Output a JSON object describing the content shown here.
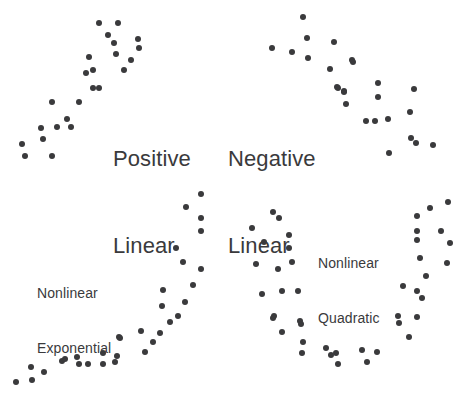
{
  "figure": {
    "width": 473,
    "height": 403,
    "background": "#ffffff",
    "dot_color": "#3a3a3c",
    "dot_diameter_px": 6
  },
  "chart_data": {
    "type": "scatter",
    "title": "",
    "xlabel": "",
    "ylabel": "",
    "grid": false,
    "legend": "none",
    "axes_shown": false,
    "note": "Four unlabeled-axis scatterplot panels illustrating relationship shapes. Point coordinates are given in figure pixel space (origin top-left, x right, y down).",
    "panels": [
      {
        "id": "positive-linear",
        "label_line1": "Positive",
        "label_line2": "Linear",
        "label_style": "large",
        "label_x": 113,
        "label_y": 86,
        "relationship": "positive linear",
        "n_points": 24,
        "points": [
          [
            99,
            23
          ],
          [
            118,
            23
          ],
          [
            114,
            43
          ],
          [
            138,
            39
          ],
          [
            139,
            48
          ],
          [
            89,
            57
          ],
          [
            116,
            54
          ],
          [
            93,
            70
          ],
          [
            124,
            70
          ],
          [
            93,
            88
          ],
          [
            99,
            88
          ],
          [
            52,
            102
          ],
          [
            79,
            102
          ],
          [
            41,
            128
          ],
          [
            57,
            127
          ],
          [
            71,
            127
          ],
          [
            43,
            139
          ],
          [
            22,
            144
          ],
          [
            25,
            156
          ],
          [
            52,
            156
          ],
          [
            86,
            73
          ],
          [
            108,
            35
          ],
          [
            131,
            60
          ],
          [
            67,
            119
          ]
        ]
      },
      {
        "id": "negative-linear",
        "label_line1": "Negative",
        "label_line2": "Linear",
        "label_style": "large",
        "label_x": 228,
        "label_y": 86,
        "relationship": "negative linear",
        "n_points": 25,
        "points": [
          [
            303,
            17
          ],
          [
            307,
            38
          ],
          [
            334,
            42
          ],
          [
            272,
            48
          ],
          [
            292,
            52
          ],
          [
            308,
            58
          ],
          [
            352,
            60
          ],
          [
            330,
            69
          ],
          [
            338,
            88
          ],
          [
            344,
            91
          ],
          [
            353,
            62
          ],
          [
            337,
            87
          ],
          [
            344,
            92
          ],
          [
            378,
            83
          ],
          [
            414,
            89
          ],
          [
            346,
            104
          ],
          [
            378,
            97
          ],
          [
            410,
            112
          ],
          [
            366,
            121
          ],
          [
            375,
            121
          ],
          [
            388,
            119
          ],
          [
            411,
            138
          ],
          [
            416,
            143
          ],
          [
            433,
            145
          ],
          [
            389,
            153
          ]
        ]
      },
      {
        "id": "nonlinear-exponential",
        "label_line1": "Nonlinear",
        "label_line2": "Exponential",
        "label_style": "small",
        "label_x": 37,
        "label_y": 247,
        "relationship": "nonlinear exponential",
        "n_points": 32,
        "points": [
          [
            16,
            382
          ],
          [
            31,
            367
          ],
          [
            32,
            380
          ],
          [
            44,
            372
          ],
          [
            62,
            361
          ],
          [
            65,
            359
          ],
          [
            77,
            357
          ],
          [
            79,
            364
          ],
          [
            88,
            364
          ],
          [
            103,
            353
          ],
          [
            103,
            364
          ],
          [
            115,
            362
          ],
          [
            117,
            356
          ],
          [
            119,
            337
          ],
          [
            141,
            331
          ],
          [
            145,
            352
          ],
          [
            153,
            342
          ],
          [
            160,
            333
          ],
          [
            162,
            306
          ],
          [
            163,
            290
          ],
          [
            170,
            322
          ],
          [
            176,
            248
          ],
          [
            178,
            316
          ],
          [
            183,
            262
          ],
          [
            185,
            302
          ],
          [
            186,
            207
          ],
          [
            193,
            285
          ],
          [
            201,
            194
          ],
          [
            201,
            218
          ],
          [
            201,
            231
          ],
          [
            201,
            269
          ],
          [
            120,
            338
          ]
        ]
      },
      {
        "id": "nonlinear-quadratic",
        "label_line1": "Nonlinear",
        "label_line2": "Quadratic",
        "label_style": "small",
        "label_x": 318,
        "label_y": 217,
        "relationship": "nonlinear quadratic (U-shaped)",
        "n_points": 43,
        "points": [
          [
            273,
            212
          ],
          [
            279,
            218
          ],
          [
            252,
            228
          ],
          [
            289,
            235
          ],
          [
            264,
            242
          ],
          [
            289,
            248
          ],
          [
            256,
            264
          ],
          [
            292,
            262
          ],
          [
            278,
            269
          ],
          [
            262,
            294
          ],
          [
            282,
            291
          ],
          [
            298,
            291
          ],
          [
            274,
            316
          ],
          [
            300,
            321
          ],
          [
            273,
            318
          ],
          [
            301,
            324
          ],
          [
            282,
            332
          ],
          [
            303,
            342
          ],
          [
            326,
            348
          ],
          [
            302,
            353
          ],
          [
            331,
            355
          ],
          [
            336,
            353
          ],
          [
            338,
            364
          ],
          [
            362,
            350
          ],
          [
            367,
            362
          ],
          [
            377,
            352
          ],
          [
            448,
            202
          ],
          [
            430,
            208
          ],
          [
            417,
            216
          ],
          [
            417,
            231
          ],
          [
            441,
            231
          ],
          [
            417,
            240
          ],
          [
            450,
            243
          ],
          [
            420,
            258
          ],
          [
            447,
            263
          ],
          [
            426,
            276
          ],
          [
            403,
            286
          ],
          [
            417,
            291
          ],
          [
            422,
            298
          ],
          [
            398,
            316
          ],
          [
            417,
            317
          ],
          [
            399,
            323
          ],
          [
            409,
            337
          ]
        ]
      }
    ]
  }
}
